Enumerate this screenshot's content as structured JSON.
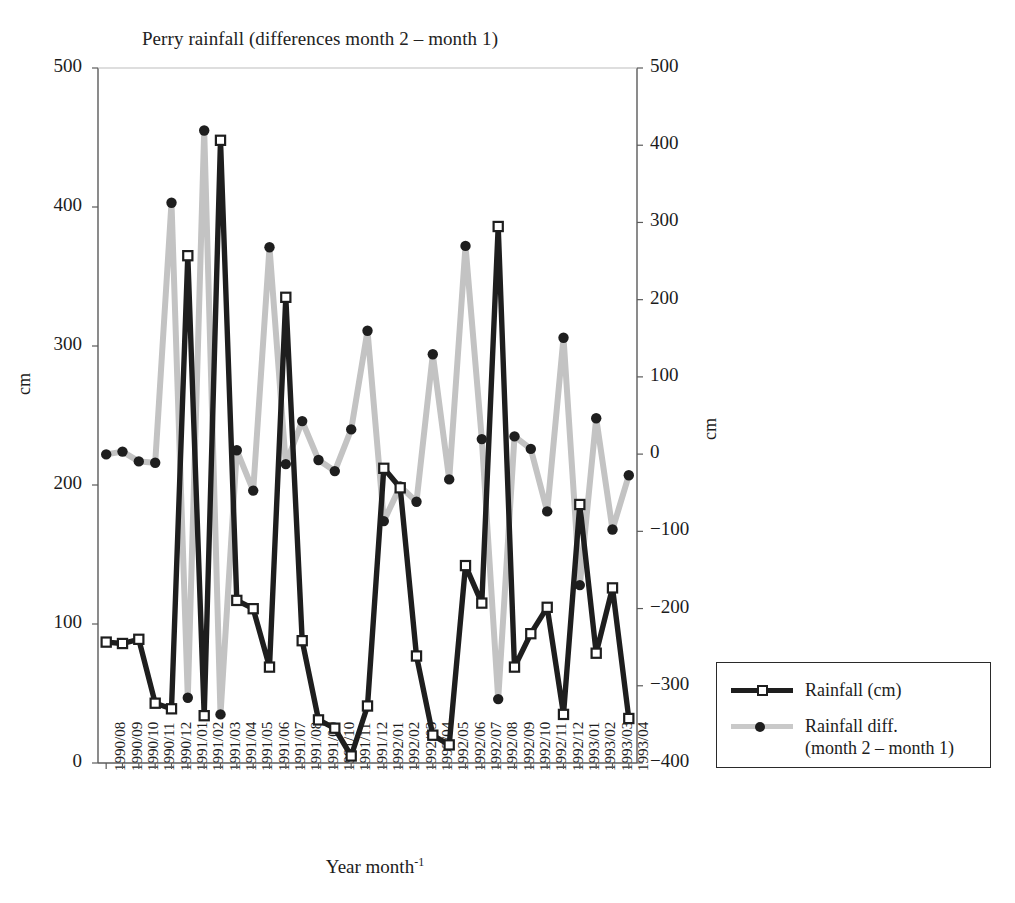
{
  "chart_data": {
    "type": "line",
    "title": "Perry rainfall (differences month 2 – month 1)",
    "xlabel": "Year month",
    "xlabel_sup": "-1",
    "ylabel_left": "cm",
    "ylabel_right": "cm",
    "grid": false,
    "legend_position": "right-outside",
    "ylim_left": [
      0,
      500
    ],
    "ylim_right": [
      -400,
      500
    ],
    "yticks_left": [
      0,
      100,
      200,
      300,
      400,
      500
    ],
    "yticks_right": [
      "−400",
      "−300",
      "−200",
      "−100",
      "0",
      "100",
      "200",
      "300",
      "400",
      "500"
    ],
    "yticks_right_values": [
      -400,
      -300,
      -200,
      -100,
      0,
      100,
      200,
      300,
      400,
      500
    ],
    "categories": [
      "1990/08",
      "1990/09",
      "1990/10",
      "1990/11",
      "1990/12",
      "1991/01",
      "1991/02",
      "1991/03",
      "1991/04",
      "1991/05",
      "1991/06",
      "1991/07",
      "1991/08",
      "1991/09",
      "1991/10",
      "1991/11",
      "1991/12",
      "1992/01",
      "1992/02",
      "1992/03",
      "1992/04",
      "1992/05",
      "1992/06",
      "1992/07",
      "1992/08",
      "1992/09",
      "1992/10",
      "1992/11",
      "1992/12",
      "1993/01",
      "1993/02",
      "1993/03",
      "1993/04"
    ],
    "series": [
      {
        "name": "Rainfall (cm)",
        "axis": "left",
        "color": "#1e1e1e",
        "marker": "open-square",
        "values": [
          87,
          86,
          89,
          43,
          39,
          365,
          34,
          448,
          117,
          111,
          69,
          335,
          88,
          31,
          25,
          5,
          41,
          212,
          198,
          77,
          20,
          13,
          142,
          115,
          386,
          69,
          93,
          112,
          35,
          186,
          79,
          126,
          32
        ]
      },
      {
        "name": "Rainfall  diff.\n(month 2 – month 1)",
        "axis": "right",
        "color": "#c3c3c3",
        "marker": "filled-circle",
        "values_left_scale": [
          222,
          224,
          217,
          216,
          403,
          47,
          455,
          35,
          225,
          196,
          371,
          215,
          246,
          218,
          210,
          240,
          311,
          174,
          199,
          188,
          294,
          204,
          372,
          233,
          46,
          235,
          226,
          181,
          306,
          128,
          248,
          168,
          207
        ],
        "values": [
          0,
          2,
          -4,
          -5,
          316,
          -122,
          363,
          -135,
          3,
          -25,
          278,
          -3,
          25,
          -3,
          -10,
          17,
          90,
          -35,
          -17,
          -24,
          141,
          -19,
          279,
          9,
          -124,
          11,
          2,
          -37,
          75,
          -84,
          23,
          -48,
          -8
        ]
      }
    ]
  },
  "legend": {
    "items": [
      {
        "label": "Rainfall (cm)"
      },
      {
        "label": "Rainfall  diff.\n(month 2 – month 1)"
      }
    ]
  }
}
